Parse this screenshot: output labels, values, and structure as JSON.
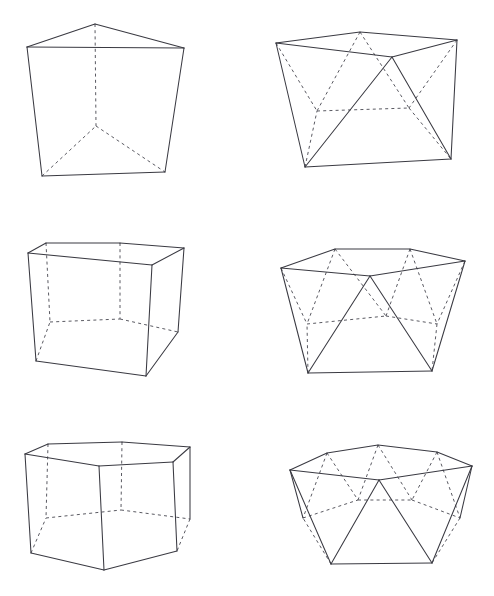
{
  "page": {
    "background_color": "#ffffff",
    "solid_edge_color": "#3a3a42",
    "hidden_edge_color": "#5a5a62",
    "width": 494,
    "height": 596,
    "line_style_note": "visible edges solid, hidden edges dashed"
  },
  "figures": [
    {
      "id": "triangular-prism",
      "name": "triangular prism",
      "family": "prism",
      "base_polygon_sides": 3,
      "row": 1,
      "column": 1,
      "origin": {
        "x": 0,
        "y": 0
      },
      "top_polygon": [
        {
          "x": 27,
          "y": 47
        },
        {
          "x": 95,
          "y": 24
        },
        {
          "x": 184,
          "y": 48
        }
      ],
      "bottom_polygon": [
        {
          "x": 42,
          "y": 176
        },
        {
          "x": 96,
          "y": 126
        },
        {
          "x": 165,
          "y": 172
        }
      ],
      "visible_top_edges": [
        [
          0,
          1
        ],
        [
          1,
          2
        ],
        [
          2,
          0
        ]
      ],
      "hidden_top_edges": [],
      "visible_bottom_edges": [
        [
          0,
          2
        ]
      ],
      "hidden_bottom_edges": [
        [
          0,
          1
        ],
        [
          1,
          2
        ]
      ],
      "visible_verticals": [
        0,
        2
      ],
      "hidden_verticals": [
        1
      ]
    },
    {
      "id": "square-antiprism",
      "name": "square antiprism",
      "family": "antiprism",
      "base_polygon_sides": 4,
      "row": 1,
      "column": 2,
      "origin": {
        "x": 247,
        "y": 0
      },
      "top_polygon": [
        {
          "x": 276,
          "y": 43
        },
        {
          "x": 360,
          "y": 32
        },
        {
          "x": 457,
          "y": 40
        },
        {
          "x": 392,
          "y": 57
        }
      ],
      "bottom_polygon": [
        {
          "x": 305,
          "y": 167
        },
        {
          "x": 317,
          "y": 111
        },
        {
          "x": 409,
          "y": 108
        },
        {
          "x": 451,
          "y": 159
        }
      ],
      "visible_top_edges": [
        [
          0,
          1
        ],
        [
          1,
          2
        ],
        [
          2,
          3
        ],
        [
          3,
          0
        ]
      ],
      "hidden_top_edges": [],
      "visible_bottom_edges": [
        [
          0,
          3
        ]
      ],
      "hidden_bottom_edges": [
        [
          0,
          1
        ],
        [
          1,
          2
        ],
        [
          2,
          3
        ]
      ],
      "visible_zigzag": [
        [
          "t0",
          "b0"
        ],
        [
          "t3",
          "b0"
        ],
        [
          "t3",
          "b3"
        ],
        [
          "t2",
          "b3"
        ]
      ],
      "hidden_zigzag": [
        [
          "t0",
          "b1"
        ],
        [
          "t1",
          "b1"
        ],
        [
          "t1",
          "b2"
        ],
        [
          "t2",
          "b2"
        ]
      ]
    },
    {
      "id": "pentagonal-prism",
      "name": "pentagonal prism",
      "family": "prism",
      "base_polygon_sides": 5,
      "row": 2,
      "column": 1,
      "origin": {
        "x": 0,
        "y": 200
      },
      "top_polygon": [
        {
          "x": 28,
          "y": 253
        },
        {
          "x": 46,
          "y": 243
        },
        {
          "x": 120,
          "y": 243
        },
        {
          "x": 184,
          "y": 248
        },
        {
          "x": 152,
          "y": 265
        }
      ],
      "bottom_polygon": [
        {
          "x": 36,
          "y": 361
        },
        {
          "x": 50,
          "y": 322
        },
        {
          "x": 120,
          "y": 319
        },
        {
          "x": 178,
          "y": 332
        },
        {
          "x": 146,
          "y": 376
        }
      ],
      "visible_top_edges": [
        [
          0,
          1
        ],
        [
          1,
          2
        ],
        [
          2,
          3
        ],
        [
          3,
          4
        ],
        [
          4,
          0
        ]
      ],
      "hidden_top_edges": [],
      "visible_bottom_edges": [
        [
          4,
          0
        ],
        [
          3,
          4
        ]
      ],
      "hidden_bottom_edges": [
        [
          0,
          1
        ],
        [
          1,
          2
        ],
        [
          2,
          3
        ]
      ],
      "visible_verticals": [
        0,
        3,
        4
      ],
      "hidden_verticals": [
        1,
        2
      ]
    },
    {
      "id": "pentagonal-antiprism",
      "name": "pentagonal antiprism",
      "family": "antiprism",
      "base_polygon_sides": 5,
      "row": 2,
      "column": 2,
      "origin": {
        "x": 247,
        "y": 200
      },
      "top_polygon": [
        {
          "x": 281,
          "y": 268
        },
        {
          "x": 335,
          "y": 249
        },
        {
          "x": 410,
          "y": 249
        },
        {
          "x": 465,
          "y": 261
        },
        {
          "x": 370,
          "y": 276
        }
      ],
      "bottom_polygon": [
        {
          "x": 308,
          "y": 373
        },
        {
          "x": 307,
          "y": 324
        },
        {
          "x": 386,
          "y": 316
        },
        {
          "x": 437,
          "y": 324
        },
        {
          "x": 432,
          "y": 371
        }
      ],
      "visible_top_edges": [
        [
          0,
          1
        ],
        [
          1,
          2
        ],
        [
          2,
          3
        ],
        [
          3,
          4
        ],
        [
          4,
          0
        ]
      ],
      "hidden_top_edges": [],
      "visible_bottom_edges": [
        [
          0,
          4
        ]
      ],
      "hidden_bottom_edges": [
        [
          0,
          1
        ],
        [
          1,
          2
        ],
        [
          2,
          3
        ],
        [
          3,
          4
        ]
      ],
      "visible_zigzag": [
        [
          "t0",
          "b0"
        ],
        [
          "t4",
          "b0"
        ],
        [
          "t4",
          "b4"
        ],
        [
          "t3",
          "b4"
        ]
      ],
      "hidden_zigzag": [
        [
          "t0",
          "b1"
        ],
        [
          "t1",
          "b1"
        ],
        [
          "t1",
          "b2"
        ],
        [
          "t2",
          "b2"
        ],
        [
          "t2",
          "b3"
        ],
        [
          "t3",
          "b3"
        ]
      ]
    },
    {
      "id": "hexagonal-prism",
      "name": "hexagonal prism",
      "family": "prism",
      "base_polygon_sides": 6,
      "row": 3,
      "column": 1,
      "origin": {
        "x": 0,
        "y": 400
      },
      "top_polygon": [
        {
          "x": 25,
          "y": 454
        },
        {
          "x": 48,
          "y": 444
        },
        {
          "x": 122,
          "y": 442
        },
        {
          "x": 190,
          "y": 447
        },
        {
          "x": 173,
          "y": 462
        },
        {
          "x": 99,
          "y": 466
        }
      ],
      "bottom_polygon": [
        {
          "x": 31,
          "y": 553
        },
        {
          "x": 46,
          "y": 518
        },
        {
          "x": 121,
          "y": 510
        },
        {
          "x": 190,
          "y": 519
        },
        {
          "x": 177,
          "y": 551
        },
        {
          "x": 104,
          "y": 570
        }
      ],
      "visible_top_edges": [
        [
          0,
          1
        ],
        [
          1,
          2
        ],
        [
          2,
          3
        ],
        [
          3,
          4
        ],
        [
          4,
          5
        ],
        [
          5,
          0
        ]
      ],
      "hidden_top_edges": [],
      "visible_bottom_edges": [
        [
          4,
          5
        ],
        [
          5,
          0
        ]
      ],
      "hidden_bottom_edges": [
        [
          0,
          1
        ],
        [
          1,
          2
        ],
        [
          2,
          3
        ],
        [
          3,
          4
        ]
      ],
      "visible_verticals": [
        0,
        3,
        4,
        5
      ],
      "hidden_verticals": [
        1,
        2
      ]
    },
    {
      "id": "hexagonal-antiprism",
      "name": "hexagonal antiprism",
      "family": "antiprism",
      "base_polygon_sides": 6,
      "row": 3,
      "column": 2,
      "origin": {
        "x": 247,
        "y": 400
      },
      "top_polygon": [
        {
          "x": 290,
          "y": 470
        },
        {
          "x": 327,
          "y": 453
        },
        {
          "x": 378,
          "y": 445
        },
        {
          "x": 437,
          "y": 452
        },
        {
          "x": 472,
          "y": 466
        },
        {
          "x": 379,
          "y": 480
        }
      ],
      "bottom_polygon": [
        {
          "x": 331,
          "y": 564
        },
        {
          "x": 303,
          "y": 518
        },
        {
          "x": 358,
          "y": 500
        },
        {
          "x": 412,
          "y": 500
        },
        {
          "x": 460,
          "y": 518
        },
        {
          "x": 432,
          "y": 563
        }
      ],
      "visible_top_edges": [
        [
          0,
          1
        ],
        [
          1,
          2
        ],
        [
          2,
          3
        ],
        [
          3,
          4
        ],
        [
          4,
          5
        ],
        [
          5,
          0
        ]
      ],
      "hidden_top_edges": [],
      "visible_bottom_edges": [
        [
          0,
          5
        ]
      ],
      "hidden_bottom_edges": [
        [
          0,
          1
        ],
        [
          1,
          2
        ],
        [
          2,
          3
        ],
        [
          3,
          4
        ],
        [
          4,
          5
        ]
      ],
      "visible_zigzag": [
        [
          "t0",
          "b0"
        ],
        [
          "t5",
          "b0"
        ],
        [
          "t5",
          "b5"
        ],
        [
          "t4",
          "b5"
        ],
        [
          "t0",
          "b1"
        ],
        [
          "t4",
          "b4"
        ]
      ],
      "hidden_zigzag": [
        [
          "t1",
          "b1"
        ],
        [
          "t1",
          "b2"
        ],
        [
          "t2",
          "b2"
        ],
        [
          "t2",
          "b3"
        ],
        [
          "t3",
          "b3"
        ],
        [
          "t3",
          "b4"
        ]
      ]
    }
  ]
}
